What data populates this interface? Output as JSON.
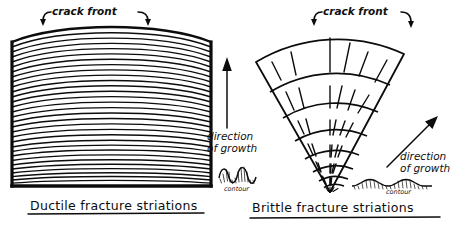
{
  "figure": {
    "title": "",
    "type": "hand-drawn engineering diagram",
    "panels": [
      {
        "id": "ductile",
        "caption": "Ductile fracture striations",
        "crack_front_label": "crack front",
        "shape": "rectangular block with dense curved striation lines",
        "striation_count": 30,
        "contour_label": "contour",
        "contour_profile": "rounded deep waves",
        "direction_label_line1": "direction",
        "direction_label_line2": "of growth",
        "arrow_direction": "up"
      },
      {
        "id": "brittle",
        "caption": "Brittle fracture striations",
        "crack_front_label": "crack front",
        "shape": "fan sector with concentric arcs and radial lines",
        "arc_count": 8,
        "radial_count": 7,
        "contour_label": "contour",
        "contour_profile": "shallow sinusoidal waves",
        "direction_label_line1": "direction",
        "direction_label_line2": "of growth",
        "arrow_direction": "up-right diagonal"
      }
    ]
  },
  "center": {
    "direction_line1": "direction",
    "direction_line2": "of growth",
    "contour_label": "contour"
  },
  "right": {
    "direction_line1": "direction",
    "direction_line2": "of growth",
    "contour_label": "contour"
  },
  "colors": {
    "ink": "#0c0c0c",
    "background": "#ffffff"
  }
}
